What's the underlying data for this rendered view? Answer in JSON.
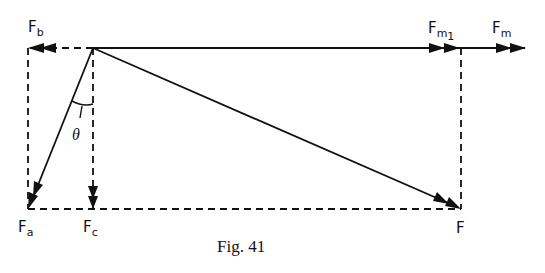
{
  "figure": {
    "caption": "Fig. 41",
    "labels": {
      "Fb": {
        "main": "F",
        "sub": "b"
      },
      "Fm1": {
        "main": "F",
        "sub": "m",
        "subsub": "1"
      },
      "Fm": {
        "main": "F",
        "sub": "m"
      },
      "Fa": {
        "main": "F",
        "sub": "a"
      },
      "Fc": {
        "main": "F",
        "sub": "c"
      },
      "F": {
        "main": "F"
      },
      "theta": "θ"
    },
    "colors": {
      "ink": "#111111",
      "background": "#ffffff"
    }
  }
}
